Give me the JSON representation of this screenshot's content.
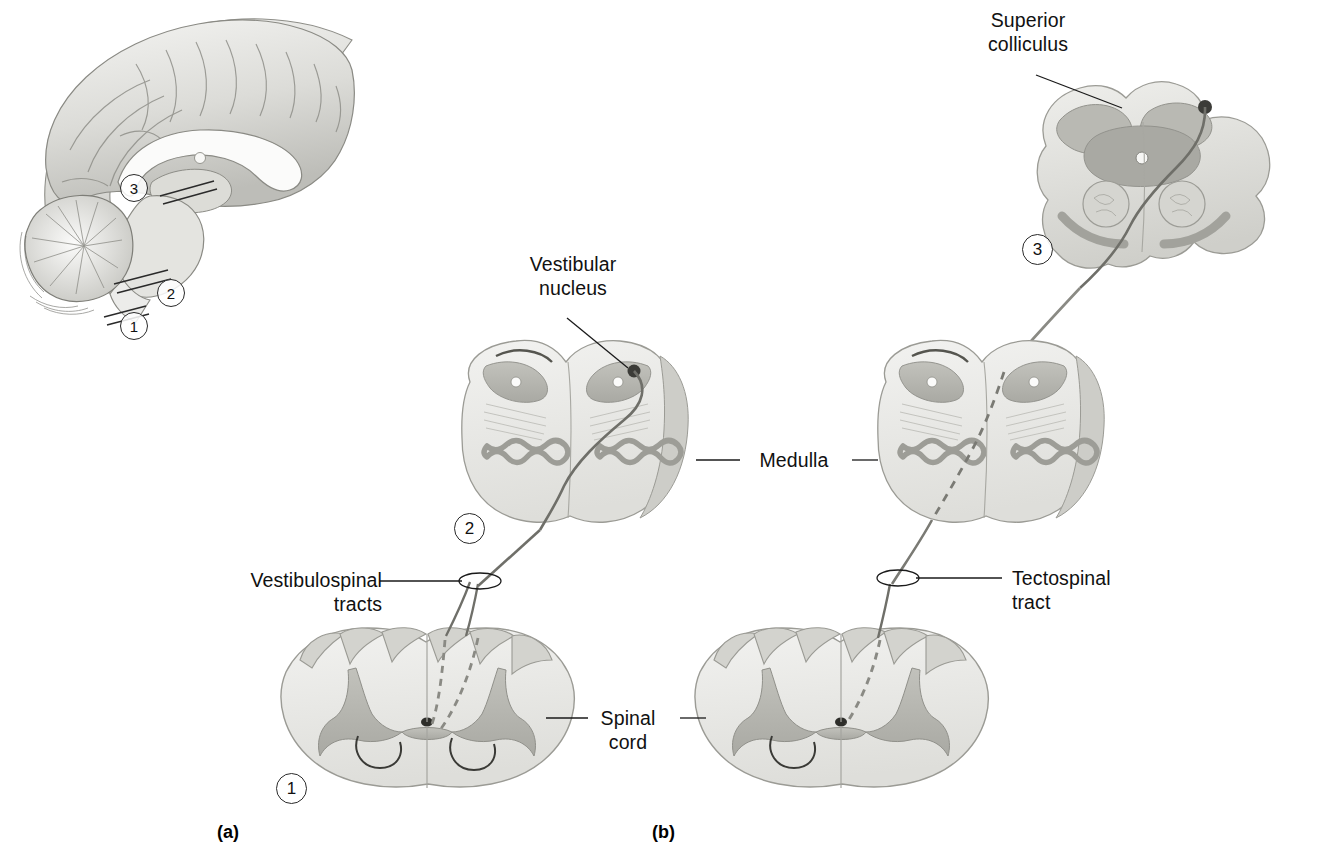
{
  "figure": {
    "type": "anatomical-diagram",
    "background_color": "#ffffff",
    "panels": [
      {
        "id": "a",
        "caption": "(a)",
        "content": "Mid-sagittal brain showing section levels 1, 2, 3"
      },
      {
        "id": "b",
        "caption": "(b)",
        "content": "Cross-sections with tract pathways"
      }
    ]
  },
  "labels": {
    "superior_colliculus": "Superior\ncolliculus",
    "vestibular_nucleus": "Vestibular\nnucleus",
    "vestibulospinal_tracts": "Vestibulospinal\ntracts",
    "tectospinal_tract": "Tectospinal\ntract",
    "medulla": "Medulla",
    "spinal_cord": "Spinal\ncord"
  },
  "section_markers": {
    "brain_inset": [
      {
        "number": "3",
        "level": "midbrain"
      },
      {
        "number": "2",
        "level": "medulla"
      },
      {
        "number": "1",
        "level": "spinal cord"
      }
    ],
    "left_column": [
      {
        "number": "2",
        "level": "medulla"
      },
      {
        "number": "1",
        "level": "spinal cord"
      }
    ],
    "right_column": [
      {
        "number": "3",
        "level": "midbrain"
      }
    ]
  },
  "captions": {
    "a": "(a)",
    "b": "(b)"
  },
  "colors": {
    "white_matter": "#e9e9e6",
    "gray_matter": "#b4b4ae",
    "outline": "#9b9b95",
    "dark_outline": "#6f6f69",
    "tract_line": "#7a7a74",
    "text": "#111111",
    "leader": "#1a1a1a"
  }
}
